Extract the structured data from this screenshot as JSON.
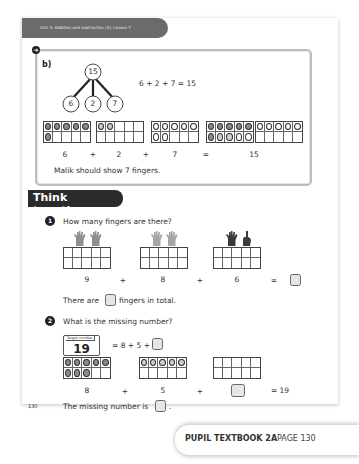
{
  "header": {
    "unit_label": "Unit 3: Addition and subtraction (2), Lesson 7"
  },
  "part_b": {
    "label": "b)",
    "part_whole": {
      "whole": "15",
      "parts": [
        "6",
        "2",
        "7"
      ]
    },
    "equation": "6 + 2 + 7 = 15",
    "ten_frames_row": [
      "6",
      "+",
      "2",
      "+",
      "7",
      "=",
      "15"
    ],
    "conclusion": "Malik should show 7 fingers."
  },
  "think_together": {
    "title": "Think together",
    "q1": {
      "number": "1",
      "question": "How many fingers are there?",
      "values": [
        "9",
        "8",
        "6"
      ],
      "operators": [
        "+",
        "+",
        "="
      ],
      "sentence_before": "There are",
      "sentence_after": "fingers in total."
    },
    "q2": {
      "number": "2",
      "question": "What is the missing number?",
      "target_label": "Target number",
      "target_value": "19",
      "equation": "= 8 + 5 +",
      "values": [
        "8",
        "5"
      ],
      "operators": [
        "+",
        "+"
      ],
      "result": "= 19",
      "sentence_before": "The missing number is",
      "sentence_after": "."
    }
  },
  "page_number": "130",
  "footer": {
    "book": "PUPIL TEXTBOOK 2A",
    "page": "PAGE 130"
  },
  "colors": {
    "tab_gray": "#6b6b6b",
    "think_dark": "#2b2b2b",
    "counter_dark": "#8a8a8a",
    "counter_light": "#cfcfcf",
    "box_border": "#bdbdbd"
  }
}
